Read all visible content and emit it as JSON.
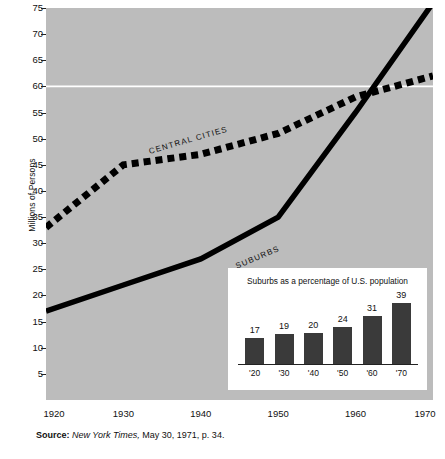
{
  "chart_data": {
    "type": "line",
    "title": "",
    "xlabel": "",
    "ylabel": "Millions of Persons",
    "xlim": [
      1920,
      1970
    ],
    "ylim": [
      0,
      75
    ],
    "yticks": [
      5,
      10,
      15,
      20,
      25,
      30,
      35,
      40,
      45,
      50,
      55,
      60,
      65,
      70,
      75
    ],
    "xticks": [
      1920,
      1930,
      1940,
      1950,
      1960,
      1970
    ],
    "xtick_labels": [
      "1920",
      "1930",
      "1940",
      "1950",
      "1960",
      "1970"
    ],
    "grid": "single white horizontal reference line at 60",
    "legend": "inline labels on lines",
    "background_color": "#bcbcbc",
    "line_color": "#000000",
    "series": [
      {
        "name": "CENTRAL CITIES",
        "style": "dashed",
        "x": [
          1920,
          1930,
          1940,
          1950,
          1960,
          1970
        ],
        "values": [
          33,
          45,
          47,
          51,
          58,
          62
        ]
      },
      {
        "name": "SUBURBS",
        "style": "solid",
        "x": [
          1920,
          1930,
          1940,
          1950,
          1960,
          1970
        ],
        "values": [
          17,
          22,
          27,
          35,
          55,
          76
        ]
      }
    ],
    "annotations": [
      "CENTRAL CITIES",
      "SUBURBS"
    ]
  },
  "inset_chart": {
    "type": "bar",
    "title": "Suburbs as a percentage of U.S. population",
    "categories": [
      "'20",
      "'30",
      "'40",
      "'50",
      "'60",
      "'70"
    ],
    "values": [
      17,
      19,
      20,
      24,
      31,
      39
    ],
    "xlabel": "",
    "ylabel": "",
    "ylim": [
      0,
      45
    ],
    "bar_color": "#3a3a3a",
    "background_color": "#ffffff"
  },
  "source": {
    "prefix": "Source:",
    "publication": "New York Times,",
    "detail": "May 30, 1971, p. 34."
  }
}
